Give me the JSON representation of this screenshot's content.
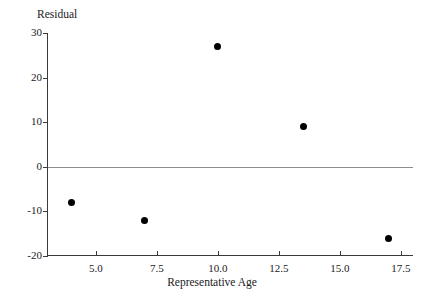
{
  "chart_data": {
    "type": "scatter",
    "title": "",
    "xlabel": "Representative Age",
    "ylabel": "Residual",
    "xlim": [
      3.0,
      18.0
    ],
    "ylim": [
      -20,
      30
    ],
    "xticks": [
      5.0,
      7.5,
      10.0,
      12.5,
      15.0,
      17.5
    ],
    "xtick_labels": [
      "5.0",
      "7.5",
      "10.0",
      "12.5",
      "15.0",
      "17.5"
    ],
    "yticks": [
      -20,
      -10,
      0,
      10,
      20,
      30
    ],
    "ytick_labels": [
      "-20",
      "-10",
      "0",
      "10",
      "20",
      "30"
    ],
    "grid": false,
    "legend": null,
    "reference_line": {
      "axis": "y",
      "value": 0,
      "color": "#8c8c8c"
    },
    "x": [
      4.0,
      7.0,
      10.0,
      13.5,
      17.0
    ],
    "y": [
      -8,
      -12,
      27,
      9,
      -16
    ],
    "points": [
      {
        "x": 4.0,
        "y": -8
      },
      {
        "x": 7.0,
        "y": -12
      },
      {
        "x": 10.0,
        "y": 27
      },
      {
        "x": 13.5,
        "y": 9
      },
      {
        "x": 17.0,
        "y": -16
      }
    ],
    "marker": {
      "shape": "circle",
      "color": "#000000",
      "size": 7
    }
  },
  "axes": {
    "y_title": "Residual",
    "x_title": "Representative Age"
  }
}
